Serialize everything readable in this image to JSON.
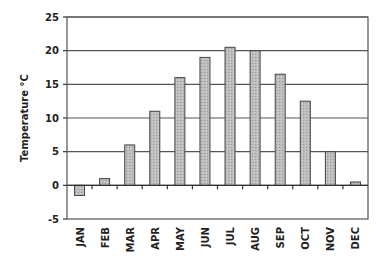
{
  "chart_data": {
    "type": "bar",
    "title": "",
    "xlabel": "",
    "ylabel": "Temperature °C",
    "categories": [
      "JAN",
      "FEB",
      "MAR",
      "APR",
      "MAY",
      "JUN",
      "JUL",
      "AUG",
      "SEP",
      "OCT",
      "NOV",
      "DEC"
    ],
    "values": [
      -1.5,
      1,
      6,
      11,
      16,
      19,
      20.5,
      20,
      16.5,
      12.5,
      5,
      0.5
    ],
    "ylim": [
      -5,
      25
    ],
    "yticks": [
      -5,
      0,
      5,
      10,
      15,
      20,
      25
    ],
    "grid": "horizontal",
    "legend": "none",
    "bar_color": "#bdbdbd",
    "bar_edge_color": "#444444"
  }
}
